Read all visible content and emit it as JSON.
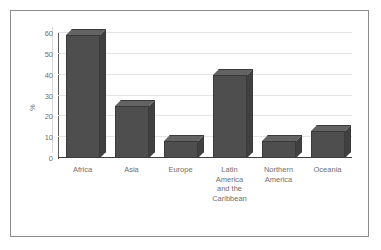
{
  "chart_data": {
    "type": "bar",
    "title": "",
    "xlabel": "",
    "ylabel": "%",
    "categories": [
      "Africa",
      "Asia",
      "Europe",
      "Latin America and the Caribbean",
      "Northern America",
      "Oceania"
    ],
    "category_lines": [
      [
        "Africa"
      ],
      [
        "Asia"
      ],
      [
        "Europe"
      ],
      [
        "Latin",
        "America",
        "and the",
        "Caribbean"
      ],
      [
        "Northern",
        "America"
      ],
      [
        "Oceania"
      ]
    ],
    "values": [
      59,
      25,
      8,
      40,
      8,
      13
    ],
    "ylim": [
      0,
      60
    ],
    "yticks": [
      0,
      10,
      20,
      30,
      40,
      50,
      60
    ],
    "ytick_labels": [
      "0",
      "10",
      "20",
      "30",
      "40",
      "50",
      "60"
    ],
    "grid": true,
    "legend": false,
    "style": "3d-column",
    "colors": {
      "bar_front": "#4e4e4e",
      "bar_top": "#636363",
      "bar_side": "#404040",
      "gridline": "#e4e4e4",
      "axis": "#5a5a5a",
      "tick_text": "#6f6f6f",
      "frame_border": "#8c8c8c",
      "background": "#ffffff"
    }
  }
}
